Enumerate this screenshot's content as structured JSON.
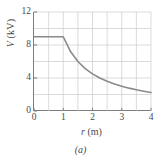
{
  "figure": {
    "caption": "(a)",
    "background_color": "#ffffff"
  },
  "chart_data": {
    "type": "line",
    "title": "",
    "subtitle": "",
    "xlabel": "r (m)",
    "xlabel_symbol": "r",
    "xlabel_unit": "(m)",
    "ylabel": "V (kV)",
    "ylabel_symbol": "V",
    "ylabel_unit": "(kV)",
    "xlim": [
      0,
      4
    ],
    "ylim": [
      0,
      12
    ],
    "xticks": [
      0,
      1,
      2,
      3,
      4
    ],
    "xticklabels": [
      "0",
      "1",
      "2",
      "3",
      "4"
    ],
    "yticks": [
      0,
      4,
      8,
      12
    ],
    "yticklabels": [
      "0",
      "4",
      "8",
      "12"
    ],
    "grid": true,
    "grid_x_step": 0.5,
    "grid_y_step": 2,
    "grid_color": "#cccccc",
    "axis_color": "#7d7d7d",
    "legend": null,
    "series": [
      {
        "name": "V(r)",
        "color": "#8a8a8a",
        "line_width": 1.6,
        "description": "Constant 9 kV inside r = 1 m, then 1/r decay outside",
        "x": [
          0,
          0.25,
          0.5,
          0.75,
          1,
          1.25,
          1.5,
          1.75,
          2,
          2.25,
          2.5,
          2.75,
          3,
          3.25,
          3.5,
          3.75,
          4
        ],
        "values": [
          9,
          9,
          9,
          9,
          9,
          7.2,
          6,
          5.14,
          4.5,
          4,
          3.6,
          3.27,
          3,
          2.77,
          2.57,
          2.4,
          2.25
        ]
      }
    ],
    "annotations": []
  }
}
